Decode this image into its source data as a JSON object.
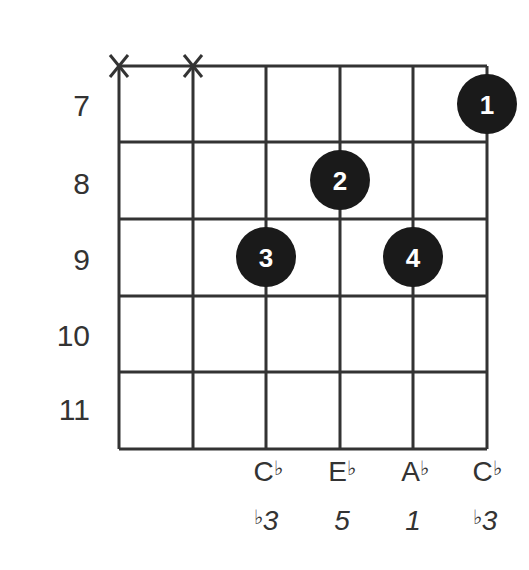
{
  "diagram": {
    "type": "guitar-chord",
    "muted_strings": [
      1,
      2
    ],
    "fret_labels": [
      "7",
      "8",
      "9",
      "10",
      "11"
    ],
    "fingers": [
      {
        "string": 6,
        "fret_row": 1,
        "label": "1"
      },
      {
        "string": 4,
        "fret_row": 2,
        "label": "2"
      },
      {
        "string": 3,
        "fret_row": 3,
        "label": "3"
      },
      {
        "string": 5,
        "fret_row": 3,
        "label": "4"
      }
    ],
    "notes": [
      {
        "string": 3,
        "letter": "C",
        "accidental": "♭",
        "interval_prefix": "♭",
        "interval": "3"
      },
      {
        "string": 4,
        "letter": "E",
        "accidental": "♭",
        "interval_prefix": "",
        "interval": "5"
      },
      {
        "string": 5,
        "letter": "A",
        "accidental": "♭",
        "interval_prefix": "",
        "interval": "1"
      },
      {
        "string": 6,
        "letter": "C",
        "accidental": "♭",
        "interval_prefix": "♭",
        "interval": "3"
      }
    ],
    "colors": {
      "line": "#333333",
      "dot": "#1a1a1a",
      "dot_text": "#ffffff"
    }
  }
}
